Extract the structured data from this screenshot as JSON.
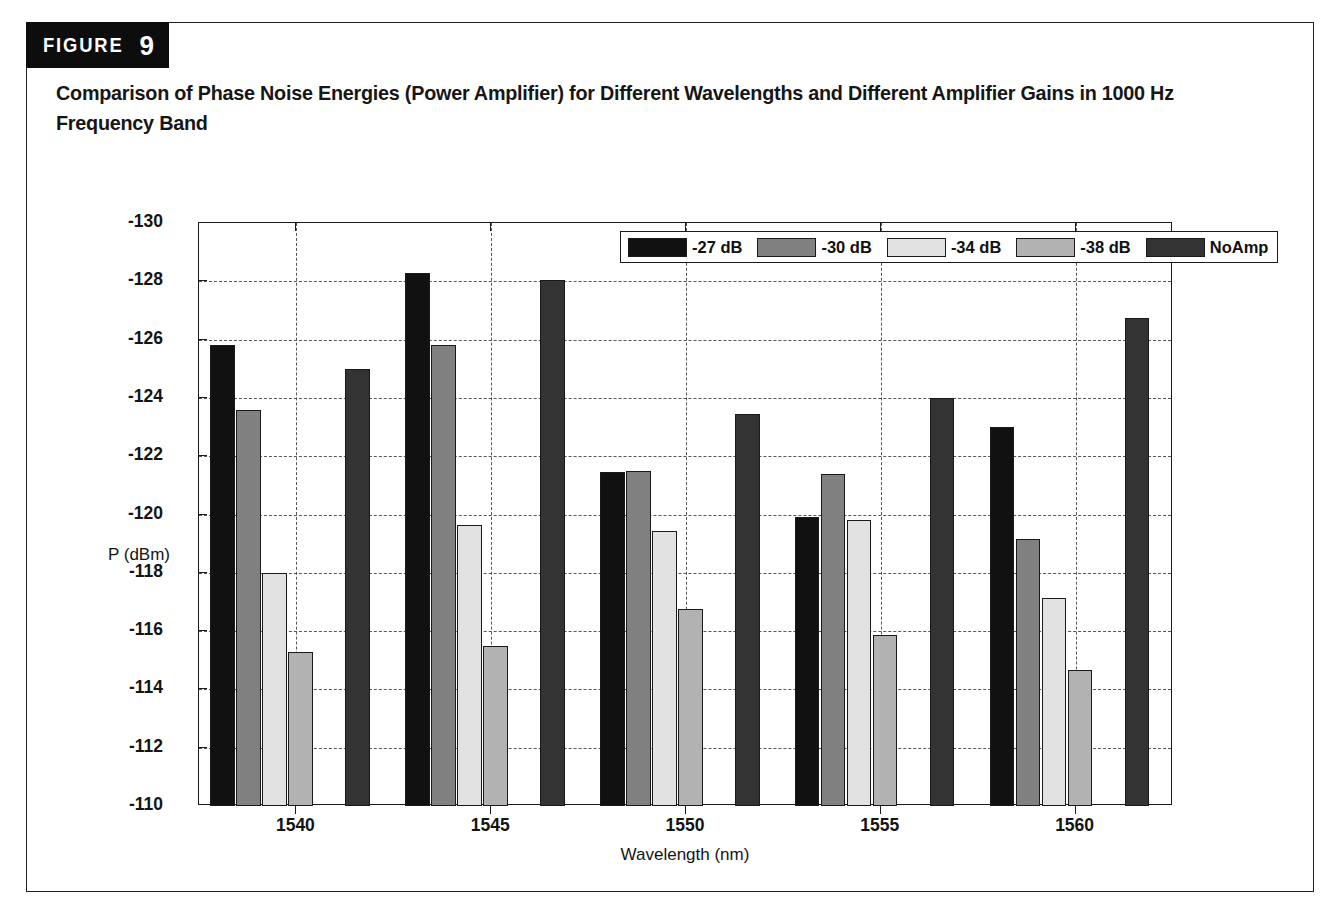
{
  "figure": {
    "tab_word": "FIGURE",
    "tab_number": "9",
    "caption": "Comparison of Phase Noise Energies (Power Amplifier) for Different Wavelengths and Different Amplifier Gains in 1000 Hz Frequency Band"
  },
  "chart_data": {
    "type": "bar",
    "title": "",
    "xlabel": "Wavelength (nm)",
    "ylabel": "P (dBm)",
    "categories": [
      "1540",
      "1545",
      "1550",
      "1555",
      "1560"
    ],
    "ylim": [
      -110,
      -130
    ],
    "y_inverted": true,
    "yticks": [
      "-130",
      "-128",
      "-126",
      "-124",
      "-122",
      "-120",
      "-118",
      "-116",
      "-114",
      "-112",
      "-110"
    ],
    "ytick_values": [
      -130,
      -128,
      -126,
      -124,
      -122,
      -120,
      -118,
      -116,
      -114,
      -112,
      -110
    ],
    "grid": true,
    "legend_position": "top-right-inside",
    "series": [
      {
        "name": "-27 dB",
        "color": "#111111",
        "values": [
          -125.8,
          -128.3,
          -121.45,
          -119.9,
          -123.0
        ]
      },
      {
        "name": "-30 dB",
        "color": "#808080",
        "values": [
          -123.6,
          -125.8,
          -121.5,
          -121.4,
          -119.15
        ]
      },
      {
        "name": "-34 dB",
        "color": "#e2e2e2",
        "values": [
          -118.0,
          -119.65,
          -119.45,
          -119.8,
          -117.15
        ]
      },
      {
        "name": "-38 dB",
        "color": "#b2b2b2",
        "values": [
          -115.3,
          -115.5,
          -116.75,
          -115.85,
          -114.65
        ]
      },
      {
        "name": "NoAmp",
        "color": "#333333",
        "values": [
          -125.0,
          -128.05,
          -123.45,
          -124.0,
          -126.75
        ]
      }
    ]
  }
}
